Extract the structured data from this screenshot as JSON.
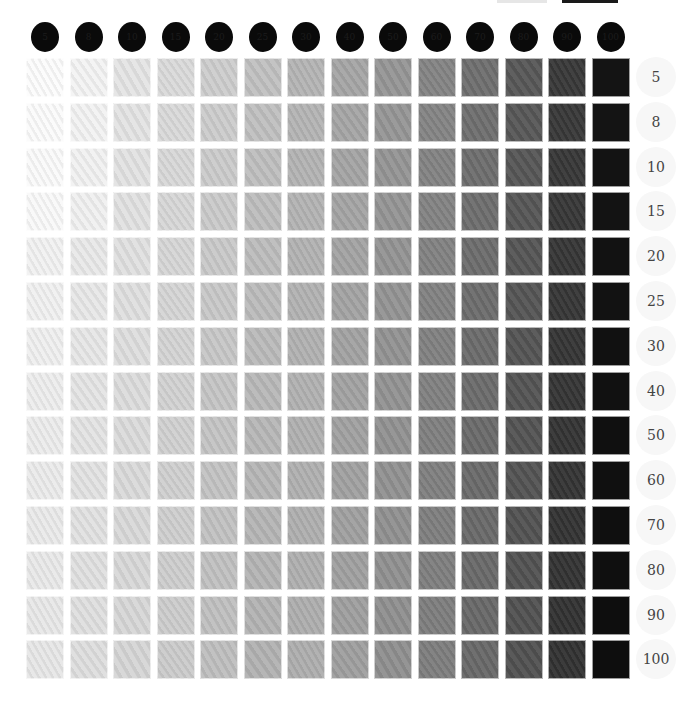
{
  "chart_data": {
    "type": "heatmap",
    "title": "",
    "column_headers": [
      "5",
      "8",
      "10",
      "15",
      "20",
      "25",
      "30",
      "40",
      "50",
      "60",
      "70",
      "80",
      "90",
      "100"
    ],
    "row_labels": [
      "5",
      "8",
      "10",
      "15",
      "20",
      "25",
      "30",
      "40",
      "50",
      "60",
      "70",
      "80",
      "90",
      "100"
    ],
    "column_gray_levels": [
      246,
      238,
      230,
      220,
      208,
      196,
      184,
      170,
      155,
      138,
      118,
      96,
      66,
      20
    ],
    "row_base_lightening": [
      10,
      9,
      8,
      7,
      6,
      5,
      4,
      3,
      2,
      1,
      0,
      0,
      0,
      0
    ],
    "xlabel": "",
    "ylabel": "",
    "grid": false,
    "legend_position": "none"
  },
  "header": {
    "circles": [
      "5",
      "8",
      "10",
      "15",
      "20",
      "25",
      "30",
      "40",
      "50",
      "60",
      "70",
      "80",
      "90",
      "100"
    ]
  },
  "rows": {
    "labels": [
      "5",
      "8",
      "10",
      "15",
      "20",
      "25",
      "30",
      "40",
      "50",
      "60",
      "70",
      "80",
      "90",
      "100"
    ]
  },
  "colors": {
    "circle": "#0a0a0a",
    "background": "#ffffff",
    "label_text": "#444444"
  }
}
